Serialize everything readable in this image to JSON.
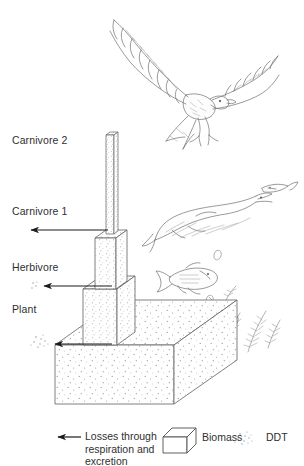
{
  "figure": {
    "type": "scientific-line-diagram",
    "colors": {
      "ink": "#2f2f2f",
      "stipple": "#8c8c8c",
      "background": "#ffffff",
      "organism_line": "#6f6f6f"
    }
  },
  "trophic_levels": [
    {
      "key": "carnivore2",
      "label": "Carnivore 2",
      "organism": "eagle-osprey",
      "has_loss_arrow": false,
      "ddt_marker": "none"
    },
    {
      "key": "carnivore1",
      "label": "Carnivore 1",
      "organism": "large-predatory-fish-eating-small-fish",
      "has_loss_arrow": true,
      "ddt_marker": "none"
    },
    {
      "key": "herbivore",
      "label": "Herbivore",
      "organism": "small-fish",
      "has_loss_arrow": true,
      "ddt_marker": "small"
    },
    {
      "key": "plant",
      "label": "Plant",
      "organism": "aquatic-pondweed",
      "has_loss_arrow": true,
      "ddt_marker": "large"
    }
  ],
  "legend": {
    "losses": {
      "icon": "left-arrow-icon",
      "label": "Losses through\nrespiration and\nexcretion"
    },
    "biomass": {
      "icon": "cuboid-icon",
      "label": "Biomass"
    },
    "ddt": {
      "icon": "speckle-icon",
      "label": "DDT"
    }
  }
}
